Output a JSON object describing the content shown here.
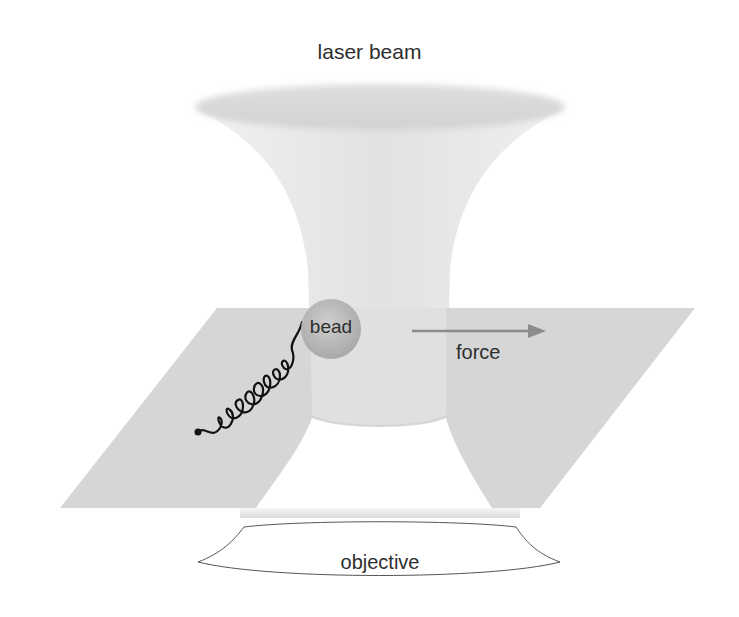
{
  "diagram": {
    "labels": {
      "laser_beam": "laser beam",
      "bead": "bead",
      "force": "force",
      "objective": "objective"
    },
    "colors": {
      "background": "#ffffff",
      "beam": "#e8e8e8",
      "beam_top": "#d9d9d9",
      "sample_plane": "#d6d6d6",
      "bead_fill": "#b8b8b8",
      "force_arrow": "#8c8c8c",
      "tether": "#111111",
      "label_text": "#2e2e2e"
    },
    "elements": [
      {
        "id": "laser-beam",
        "shape": "hourglass-cone",
        "top_ellipse_center": [
          380,
          107
        ],
        "waist_y": 420
      },
      {
        "id": "sample-plane",
        "shape": "parallelogram",
        "corners": [
          [
            217,
            308
          ],
          [
            695,
            308
          ],
          [
            540,
            508
          ],
          [
            60,
            508
          ]
        ]
      },
      {
        "id": "bead",
        "shape": "circle",
        "center": [
          331,
          329
        ],
        "radius": 30
      },
      {
        "id": "tether",
        "shape": "coiled-line",
        "from": [
          198,
          432
        ],
        "to": [
          302,
          322
        ]
      },
      {
        "id": "force-arrow",
        "shape": "arrow",
        "from": [
          412,
          331
        ],
        "to": [
          545,
          331
        ]
      },
      {
        "id": "objective",
        "shape": "curved-lens-outline",
        "center_x": 380,
        "y": 515
      }
    ]
  }
}
